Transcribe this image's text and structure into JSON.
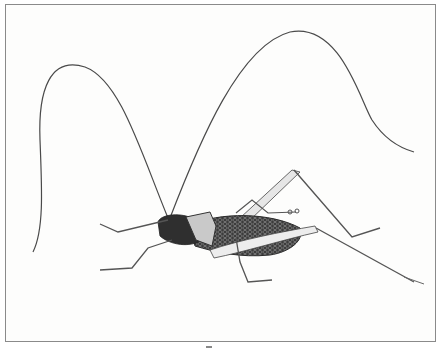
{
  "image": {
    "description": "Scientific pen-and-ink illustration of a katydid (bush cricket) in side view with very long arched antennae, dark reticulated wings, and long spindly legs",
    "subject": "katydid",
    "style": "black-and-white stipple engraving",
    "colors": {
      "background": "#fdfdfc",
      "frame": "#8a8a8a",
      "ink": "#2a2a2a",
      "body_dark": "#3a3a3a",
      "pronotum_light": "#c9c9c9"
    }
  }
}
